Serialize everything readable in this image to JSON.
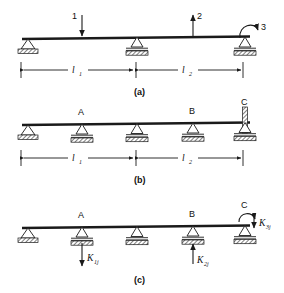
{
  "figure": {
    "panels": [
      {
        "id": "a",
        "caption": "(a)",
        "loads": [
          {
            "name": "load-1",
            "label": "1",
            "direction": "down",
            "x": 82
          },
          {
            "name": "load-2",
            "label": "2",
            "direction": "up",
            "x": 193
          },
          {
            "name": "moment-3",
            "label": "3",
            "direction": "moment",
            "x": 245
          }
        ],
        "supports": [
          {
            "name": "support-left",
            "type": "pin",
            "x": 28
          },
          {
            "name": "support-mid",
            "type": "roller",
            "x": 137
          },
          {
            "name": "support-right",
            "type": "roller",
            "x": 245
          }
        ],
        "dimensions": [
          {
            "name": "dim-l1",
            "label": "l",
            "sub": "1",
            "from": 28,
            "to": 137
          },
          {
            "name": "dim-l2",
            "label": "l",
            "sub": "2",
            "from": 137,
            "to": 245
          }
        ]
      },
      {
        "id": "b",
        "caption": "(b)",
        "supports": [
          {
            "name": "support-b-1",
            "type": "pin",
            "x": 28,
            "label": ""
          },
          {
            "name": "support-b-A",
            "type": "roller",
            "x": 82,
            "label": "A"
          },
          {
            "name": "support-b-2",
            "type": "roller",
            "x": 137,
            "label": ""
          },
          {
            "name": "support-b-B",
            "type": "roller",
            "x": 193,
            "label": "B"
          },
          {
            "name": "support-b-C",
            "type": "fixed-rotation",
            "x": 245,
            "label": "C"
          }
        ],
        "dimensions": [
          {
            "name": "dim-b-l1",
            "label": "l",
            "sub": "1",
            "from": 28,
            "to": 137
          },
          {
            "name": "dim-b-l2",
            "label": "l",
            "sub": "2",
            "from": 137,
            "to": 245
          }
        ]
      },
      {
        "id": "c",
        "caption": "(c)",
        "supports": [
          {
            "name": "support-c-1",
            "type": "pin",
            "x": 28,
            "label": ""
          },
          {
            "name": "support-c-A",
            "type": "roller",
            "x": 82,
            "label": "A"
          },
          {
            "name": "support-c-2",
            "type": "roller",
            "x": 137,
            "label": ""
          },
          {
            "name": "support-c-B",
            "type": "roller",
            "x": 193,
            "label": "B"
          },
          {
            "name": "support-c-C",
            "type": "roller",
            "x": 245,
            "label": "C"
          }
        ],
        "reactions": [
          {
            "name": "reaction-k1j",
            "label": "K",
            "sub": "1j",
            "direction": "down",
            "x": 82
          },
          {
            "name": "reaction-k2j",
            "label": "K",
            "sub": "2j",
            "direction": "up",
            "x": 193
          },
          {
            "name": "reaction-k3j",
            "label": "K",
            "sub": "3j",
            "direction": "moment",
            "x": 245
          }
        ]
      }
    ]
  },
  "colors": {
    "ink": "#1a1a1a",
    "paper": "#ffffff"
  }
}
